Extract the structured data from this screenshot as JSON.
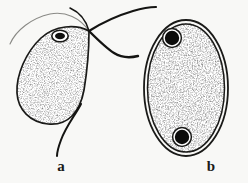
{
  "figure": {
    "background_color": "#f8f8f6",
    "ink_color": "#1a1a18",
    "panels": [
      {
        "id": "a",
        "label": "a",
        "name": "trophozoite",
        "label_position": {
          "x": 51,
          "y": 159
        },
        "body": {
          "shape": "teardrop-pear",
          "outline_color": "#1a1a18",
          "fill_texture": "stipple",
          "fill_base_color": "#ffffff",
          "stipple_color": "#2a2a28"
        },
        "nucleus": {
          "count": 1,
          "shape": "ellipse",
          "center": {
            "x": 60,
            "y": 36
          },
          "radius_x": 8,
          "radius_y": 5.5,
          "ring_color": "#1a1a18",
          "core_color": "#111110",
          "core_radius_x": 5,
          "core_radius_y": 3.2
        },
        "flagella": {
          "count": 2,
          "origin": {
            "x": 89,
            "y": 31
          },
          "color": "#141412"
        },
        "undulating_membrane": {
          "present": true,
          "color": "#7a7a76"
        },
        "axostyle_tail": {
          "present": true,
          "color": "#141412"
        }
      },
      {
        "id": "b",
        "label": "b",
        "name": "cyst",
        "label_position": {
          "x": 201,
          "y": 159
        },
        "body": {
          "shape": "ellipse",
          "outline_color": "#1a1a18",
          "wall": "double-line",
          "center": {
            "x": 186,
            "y": 88
          },
          "radius_x": 42,
          "radius_y": 68,
          "fill_texture": "stipple",
          "fill_base_color": "#ffffff",
          "stipple_color": "#2a2a28"
        },
        "nuclei": {
          "count": 2,
          "color": "#0c0c0b",
          "ring_color": "#1a1a18",
          "positions": [
            {
              "x": 172,
              "y": 38,
              "r": 9
            },
            {
              "x": 182,
              "y": 137,
              "r": 9
            }
          ]
        }
      }
    ]
  }
}
